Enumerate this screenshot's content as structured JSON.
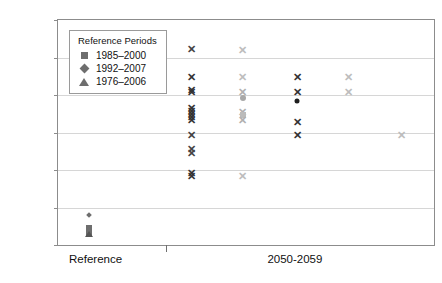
{
  "title": {
    "text": "",
    "note": "figure title cropped off at top edge — illegible"
  },
  "legend": {
    "title": "Reference Periods",
    "entries": [
      {
        "marker": "square",
        "label": "1985–2000",
        "color": "#6e6e6e"
      },
      {
        "marker": "diamond",
        "label": "1992–2007",
        "color": "#6e6e6e"
      },
      {
        "marker": "triangle",
        "label": "1976–2006",
        "color": "#6e6e6e"
      }
    ]
  },
  "axes": {
    "ylabel": "Temperature Difference (°F)",
    "yticks": [
      "0",
      "1",
      "2",
      "3",
      "4",
      "5",
      "6"
    ],
    "xticklabels": [
      "Reference",
      "2050-2059"
    ]
  },
  "colors": {
    "dark_marker": "#333333",
    "mid_marker": "#6e6e6e",
    "light_marker": "#b9b9b9",
    "gridline": "#d6d6d6",
    "frame": "#8c8c8c",
    "text": "#111111"
  },
  "chart_data": {
    "type": "scatter",
    "title": "",
    "xlabel": "",
    "ylabel": "Temperature Difference (°F)",
    "ylim": [
      0,
      6
    ],
    "yticks": [
      0,
      1,
      2,
      3,
      4,
      5,
      6
    ],
    "grid": "horizontal",
    "legend_position": "upper-left",
    "xcategories": [
      "Reference",
      "2050-2059"
    ],
    "series": [
      {
        "name": "Reference cluster",
        "xpos": 0.082,
        "color": "#6e6e6e",
        "points": [
          {
            "y": 0.8,
            "marker": "diamond",
            "color": "#6e6e6e",
            "size": 4
          },
          {
            "y": 0.45,
            "marker": "square",
            "color": "#6e6e6e",
            "size": 6
          },
          {
            "y": 0.33,
            "marker": "square",
            "color": "#6e6e6e",
            "size": 6
          },
          {
            "y": 0.3,
            "marker": "triangle",
            "color": "#555555",
            "size": 6
          }
        ]
      },
      {
        "name": "Projection group 1 (dark)",
        "xpos": 0.355,
        "color": "#333333",
        "points": [
          {
            "y": 5.22,
            "marker": "x",
            "color": "#444444"
          },
          {
            "y": 4.47,
            "marker": "x",
            "color": "#333333"
          },
          {
            "y": 4.14,
            "marker": "x",
            "color": "#333333"
          },
          {
            "y": 4.07,
            "marker": "x",
            "color": "#333333"
          },
          {
            "y": 3.66,
            "marker": "x",
            "color": "#333333"
          },
          {
            "y": 3.57,
            "marker": "x",
            "color": "#333333"
          },
          {
            "y": 3.49,
            "marker": "x",
            "color": "#333333"
          },
          {
            "y": 3.41,
            "marker": "x",
            "color": "#333333"
          },
          {
            "y": 3.34,
            "marker": "x",
            "color": "#333333"
          },
          {
            "y": 2.93,
            "marker": "x",
            "color": "#444444"
          },
          {
            "y": 2.55,
            "marker": "x",
            "color": "#444444"
          },
          {
            "y": 2.45,
            "marker": "x",
            "color": "#444444"
          },
          {
            "y": 1.92,
            "marker": "x",
            "color": "#333333"
          },
          {
            "y": 1.85,
            "marker": "x",
            "color": "#333333"
          }
        ]
      },
      {
        "name": "Projection group 2 (light)",
        "xpos": 0.492,
        "color": "#b9b9b9",
        "points": [
          {
            "y": 5.21,
            "marker": "x",
            "color": "#bdbdbd"
          },
          {
            "y": 4.49,
            "marker": "x",
            "color": "#bdbdbd"
          },
          {
            "y": 4.08,
            "marker": "x",
            "color": "#b0b0b0"
          },
          {
            "y": 3.93,
            "marker": "circle",
            "color": "#a8a8a8",
            "size": 6
          },
          {
            "y": 3.56,
            "marker": "x",
            "color": "#b0b0b0"
          },
          {
            "y": 3.47,
            "marker": "square",
            "color": "#bbbbbb",
            "size": 6
          },
          {
            "y": 3.33,
            "marker": "x",
            "color": "#b0b0b0"
          },
          {
            "y": 1.83,
            "marker": "x",
            "color": "#bdbdbd"
          }
        ]
      },
      {
        "name": "Projection group 3 (dark)",
        "xpos": 0.636,
        "color": "#333333",
        "points": [
          {
            "y": 4.47,
            "marker": "x",
            "color": "#333333"
          },
          {
            "y": 4.07,
            "marker": "x",
            "color": "#333333"
          },
          {
            "y": 3.85,
            "marker": "circle",
            "color": "#1e1e1e",
            "size": 5
          },
          {
            "y": 3.29,
            "marker": "x",
            "color": "#333333"
          },
          {
            "y": 2.94,
            "marker": "x",
            "color": "#333333"
          }
        ]
      },
      {
        "name": "Projection group 4 (light)",
        "xpos": 0.773,
        "color": "#b9b9b9",
        "points": [
          {
            "y": 4.48,
            "marker": "x",
            "color": "#bdbdbd"
          },
          {
            "y": 4.07,
            "marker": "x",
            "color": "#bdbdbd"
          }
        ]
      },
      {
        "name": "Projection group 5 (light)",
        "xpos": 0.913,
        "color": "#b9b9b9",
        "points": [
          {
            "y": 2.93,
            "marker": "x",
            "color": "#bdbdbd"
          }
        ]
      }
    ]
  }
}
